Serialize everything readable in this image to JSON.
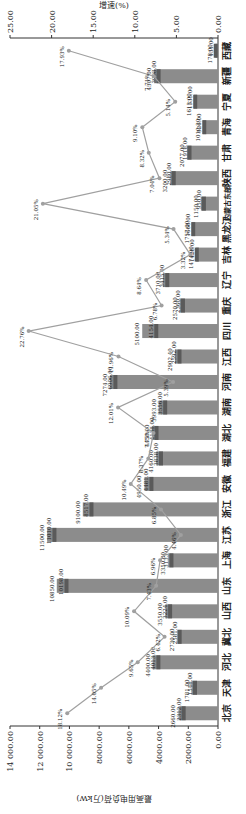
{
  "chart_data": {
    "type": "bar",
    "title": "",
    "xlabel": "",
    "ylabel": "最高用电负荷(万kW)",
    "ylabel_right": "增速(%)",
    "ylim": [
      0,
      14000
    ],
    "ylim_right": [
      0,
      25
    ],
    "yticks": [
      "0.00",
      "2000.00",
      "4000.00",
      "6000.00",
      "8000.00",
      "10 000.00",
      "12 000.00",
      "14 000.00"
    ],
    "yticks_right": [
      "0.00",
      "5.00",
      "10.00",
      "15.00",
      "20.00",
      "25.00"
    ],
    "categories": [
      "北京",
      "天津",
      "河北",
      "冀北",
      "山西",
      "山东",
      "上海",
      "江苏",
      "浙江",
      "安徽",
      "福建",
      "湖北",
      "湖南",
      "河南",
      "江西",
      "四川",
      "重庆",
      "辽宁",
      "吉林",
      "黑龙江",
      "内蒙古东部",
      "陕西",
      "甘肃",
      "青海",
      "宁夏",
      "新疆",
      "西藏"
    ],
    "series": [
      {
        "name": "预测最高用电负荷",
        "type": "bar",
        "axis": "left",
        "values": [
          2660,
          1781,
          4400,
          2730,
          3550,
          10850,
          3350,
          11500,
          9100,
          4950,
          4160,
          4450,
          3993,
          7274,
          2902.4,
          5100,
          2570,
          3710,
          1474.9,
          1757,
          1150,
          3200,
          2077,
          1010.3,
          1613,
          4307,
          178
        ]
      },
      {
        "name": "实际最高用电负荷",
        "type": "bar",
        "axis": "left",
        "values": [
          2312,
          1548,
          4013,
          2581,
          3224,
          10198,
          3133,
          11010,
          8517,
          4481,
          3838,
          4138,
          3556,
          6906,
          2592,
          4154,
          2360,
          3415,
          1428,
          1668,
          950,
          2980,
          1918,
          926,
          1535,
          3998,
          151
        ]
      },
      {
        "name": "增速",
        "type": "line",
        "axis": "right",
        "unit": "%",
        "values": [
          18.12,
          14.05,
          9.65,
          6.42,
          10.09,
          7.43,
          6.96,
          4.46,
          6.85,
          10.49,
          8.37,
          7.75,
          12.01,
          5.39,
          11.96,
          22.76,
          6.78,
          8.64,
          3.32,
          5.34,
          21.05,
          7.04,
          8.32,
          9.1,
          5.14,
          7.71,
          17.93
        ]
      }
    ],
    "grid": false,
    "orientation": "rotated 90° counter-clockwise"
  },
  "colors": {
    "bar": "#8c8c8c",
    "bar_dark": "#5a5a5a",
    "line": "#a0a0a0",
    "axis": "#333333",
    "text": "#222222"
  }
}
